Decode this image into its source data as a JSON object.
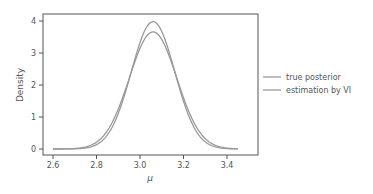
{
  "chart_data": {
    "type": "line",
    "title": "",
    "xlabel": "μ",
    "ylabel": "Density",
    "xlim": [
      2.55,
      3.5
    ],
    "ylim": [
      -0.2,
      4.15
    ],
    "xticks": [
      2.6,
      2.8,
      3.0,
      3.2,
      3.4
    ],
    "xtick_labels": [
      "2.6",
      "2.8",
      "3.0",
      "3.2",
      "3.4"
    ],
    "yticks": [
      0,
      1,
      2,
      3,
      4
    ],
    "ytick_labels": [
      "0",
      "1",
      "2",
      "3",
      "4"
    ],
    "grid": false,
    "legend_position": "outside right",
    "x_range": [
      2.6,
      3.45
    ],
    "series": [
      {
        "name": "true posterior",
        "distribution": "normal",
        "mean": 3.06,
        "std": 0.1,
        "peak": 3.98,
        "color": "#999999"
      },
      {
        "name": "estimation by VI",
        "distribution": "normal",
        "mean": 3.06,
        "std": 0.109,
        "peak": 3.66,
        "color": "#999999"
      }
    ]
  },
  "legend": {
    "items": [
      {
        "label": "true posterior"
      },
      {
        "label": "estimation by VI"
      }
    ]
  }
}
